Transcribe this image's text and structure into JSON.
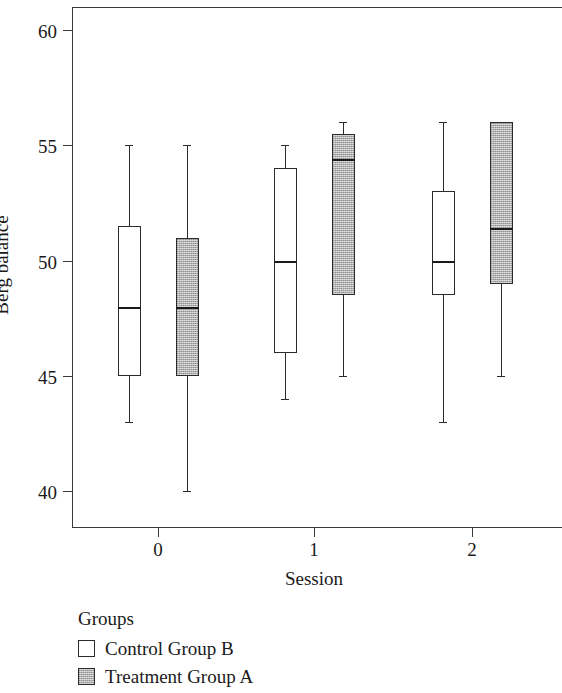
{
  "chart_data": {
    "type": "box",
    "title": "",
    "xlabel": "Session",
    "ylabel": "Berg balance",
    "categories": [
      "0",
      "1",
      "2"
    ],
    "x_tick_labels": [
      "0",
      "1",
      "2"
    ],
    "y_tick_labels": [
      "40",
      "45",
      "50",
      "55",
      "60"
    ],
    "y_ticks": [
      40,
      45,
      50,
      55,
      60
    ],
    "ylim": [
      38.4,
      61.0
    ],
    "grid": false,
    "legend_position": "below-left",
    "legend_title": "Groups",
    "series": [
      {
        "name": "Control Group B",
        "fill": "white",
        "boxes": [
          {
            "session": "0",
            "min": 43.0,
            "q1": 45.0,
            "median": 48.0,
            "q3": 51.5,
            "max": 55.0
          },
          {
            "session": "1",
            "min": 44.0,
            "q1": 46.0,
            "median": 50.0,
            "q3": 54.0,
            "max": 55.0
          },
          {
            "session": "2",
            "min": 43.0,
            "q1": 48.5,
            "median": 50.0,
            "q3": 53.0,
            "max": 56.0
          }
        ]
      },
      {
        "name": "Treatment Group A",
        "fill": "gray",
        "boxes": [
          {
            "session": "0",
            "min": 40.0,
            "q1": 45.0,
            "median": 48.0,
            "q3": 51.0,
            "max": 55.0
          },
          {
            "session": "1",
            "min": 45.0,
            "q1": 48.5,
            "median": 54.4,
            "q3": 55.5,
            "max": 56.0
          },
          {
            "session": "2",
            "min": 45.0,
            "q1": 49.0,
            "median": 51.4,
            "q3": 56.0,
            "max": 56.0
          }
        ]
      }
    ],
    "colors": {
      "control_fill": "#ffffff",
      "treatment_fill": "#b0b0b0",
      "line": "#2b2b2b",
      "background": "#ffffff"
    }
  },
  "axes": {
    "y_title": "Berg balance",
    "x_title": "Session"
  },
  "legend": {
    "title": "Groups",
    "entries": [
      {
        "label": "Control Group B",
        "fill": "white"
      },
      {
        "label": "Treatment Group A",
        "fill": "gray"
      }
    ]
  }
}
